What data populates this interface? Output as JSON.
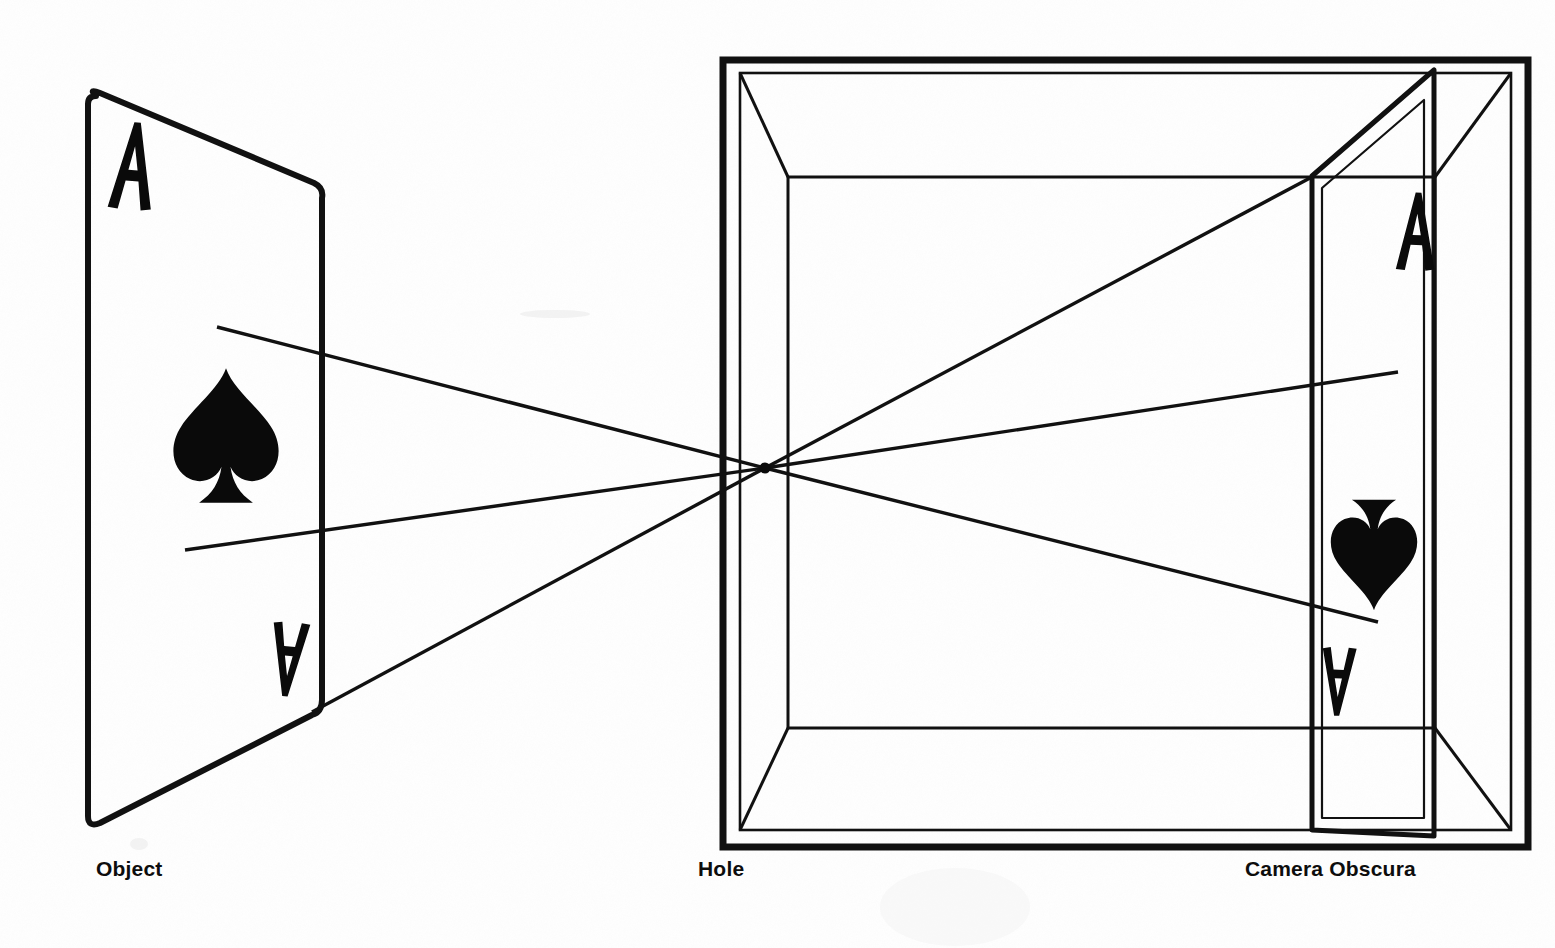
{
  "figure": {
    "medium": "scanned line drawing, black ink on white paper",
    "ink_color": "#111111",
    "paper_color": "#fefefe"
  },
  "captions": {
    "object": "Object",
    "hole": "Hole",
    "camera": "Camera Obscura"
  },
  "object_card": {
    "name": "ace-of-spades-card",
    "rank_glyph": "A",
    "suit_glyph": "spade",
    "corner_top_label": "A",
    "corner_bottom_label": "A",
    "orientation": "upright",
    "outline_points": "88,92 322,185 322,710 88,825",
    "top_index_position": {
      "x": 123,
      "y": 130
    },
    "bottom_index_position": {
      "x": 288,
      "y": 640
    },
    "suit_center": {
      "x": 226,
      "y": 450
    }
  },
  "projected_card": {
    "name": "projected-ace-of-spades",
    "rank_glyph": "A",
    "suit_glyph": "spade",
    "orientation": "inverted",
    "outline_points": "1312,175 1434,70 1434,835 1312,832",
    "top_index_position": {
      "x": 1414,
      "y": 135
    },
    "bottom_index_position": {
      "x": 1330,
      "y": 640
    },
    "suit_center": {
      "x": 1372,
      "y": 490
    }
  },
  "pinhole": {
    "name": "pinhole-aperture",
    "x": 765,
    "y": 468,
    "radius": 5
  },
  "box": {
    "name": "camera-obscura-box",
    "outer_rect": {
      "x": 723,
      "y": 60,
      "width": 805,
      "height": 787
    },
    "inner_rect": {
      "x": 740,
      "y": 73,
      "width": 771,
      "height": 757
    },
    "back_wall_rect": {
      "x": 788,
      "y": 177,
      "width": 647,
      "height": 551
    },
    "wall_line_weight_outer": 7,
    "wall_line_weight_inner": 2
  },
  "rays": [
    {
      "name": "ray-top",
      "from": {
        "x": 217,
        "y": 327
      },
      "to": {
        "x": 765,
        "y": 468
      },
      "continues_to": {
        "x": 1310,
        "y": 178
      }
    },
    {
      "name": "ray-middle",
      "from": {
        "x": 185,
        "y": 550
      },
      "to": {
        "x": 765,
        "y": 468
      },
      "continues_to": {
        "x": 1395,
        "y": 372
      }
    },
    {
      "name": "ray-bottom",
      "from": {
        "x": 312,
        "y": 712
      },
      "to": {
        "x": 765,
        "y": 468
      },
      "continues_to": {
        "x": 1378,
        "y": 622
      }
    }
  ],
  "bleed_through_text": {
    "note": "faint mirror-image show-through of text printed on the reverse of the page; illegible",
    "lines": [
      "a ,gnorts enihcam eht ni",
      "a pmal htiw ,tnemirepxe",
      "elgnis a erehw noitisiuqca",
      "eht fo tuo ecruos",
      "txen eht ot detsaw",
      "tuP",
      "aremaC",
      "thgiL",
      "fo tuo tnemele"
    ]
  }
}
